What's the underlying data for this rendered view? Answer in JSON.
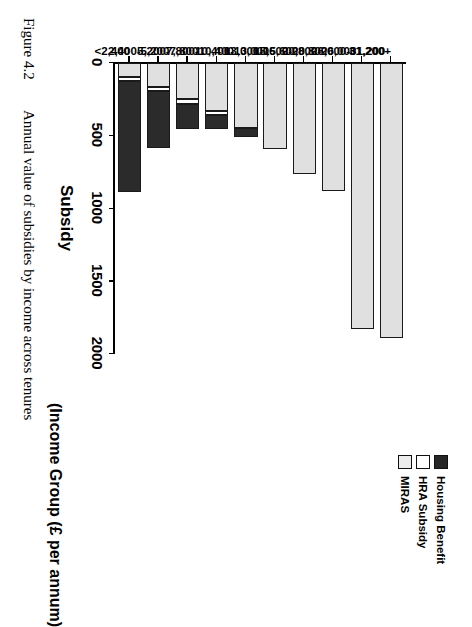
{
  "figure": {
    "number": "Figure 4.2",
    "caption": "Annual value  of   subsidies   by   income   across   tenures"
  },
  "chart_data": {
    "type": "bar",
    "orientation": "horizontal-stacked-rotated",
    "title": "",
    "xlabel": "(Income Group (£ per annum)",
    "ylabel": "Subsidy",
    "ylim": [
      0,
      2000
    ],
    "yticks": [
      0,
      500,
      1000,
      1500,
      2000
    ],
    "ytick_labels": [
      "0",
      "500",
      "1000",
      "1500",
      "2000"
    ],
    "grid": false,
    "legend_position": "top-right",
    "categories": [
      "<2,400",
      "2,400-5,200",
      "5,200-7,800",
      "7,800-10,400",
      "10,400-13,000",
      "13,000-15,600",
      "15,600-20,800",
      "20,800-26,000",
      "26,000-31,200",
      "31,200+"
    ],
    "series": [
      {
        "name": "MIRAS",
        "color": "#e0e0e0",
        "values": [
          95,
          165,
          250,
          330,
          450,
          590,
          760,
          880,
          1830,
          1890
        ]
      },
      {
        "name": "HRA Subsidy",
        "color": "#ffffff",
        "values": [
          30,
          25,
          30,
          25,
          0,
          0,
          0,
          0,
          0,
          0
        ]
      },
      {
        "name": "Housing Benefit",
        "color": "#2b2b2b",
        "values": [
          760,
          395,
          175,
          100,
          60,
          0,
          0,
          0,
          0,
          0
        ]
      }
    ],
    "totals": [
      885,
      585,
      455,
      455,
      510,
      590,
      760,
      880,
      1830,
      1890
    ]
  },
  "legend": {
    "entries": [
      {
        "label": "Housing Benefit",
        "swatch": "hb"
      },
      {
        "label": "HRA Subsidy",
        "swatch": "hra"
      },
      {
        "label": "MIRAS",
        "swatch": "miras"
      }
    ]
  }
}
